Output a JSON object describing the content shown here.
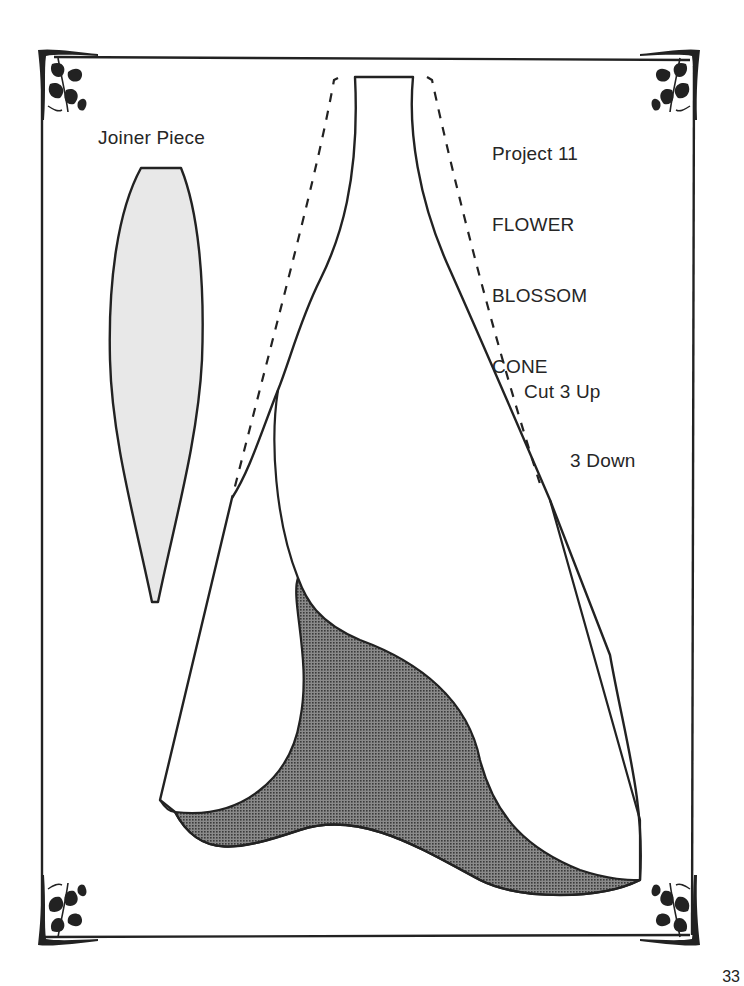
{
  "page": {
    "colors": {
      "ink": "#222222",
      "joiner_fill": "#e8e8e8",
      "shaded_fill": "#6a6a6a",
      "paper": "#ffffff"
    }
  },
  "labels": {
    "joiner_piece": "Joiner Piece",
    "title_lines": [
      "Project 11",
      "FLOWER",
      "BLOSSOM",
      "CONE"
    ],
    "cut_instructions": [
      "Cut 3 Up",
      "3 Down"
    ]
  },
  "pattern_pieces": [
    {
      "name": "joiner-piece",
      "fill": "light-gray"
    },
    {
      "name": "cone-piece",
      "fill": "white",
      "has_dashed_outline": true
    },
    {
      "name": "shaded-inner-region",
      "fill": "dotted-gray"
    }
  ],
  "decorations": {
    "corner_ornaments": [
      "top-left",
      "top-right",
      "bottom-left",
      "bottom-right"
    ],
    "ornament_icon": "leaf-vine-icon"
  },
  "page_number": "33"
}
